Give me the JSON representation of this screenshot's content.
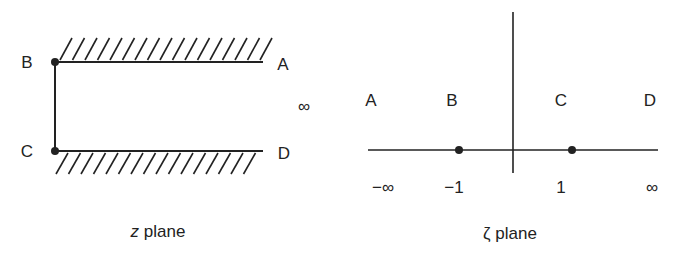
{
  "figure": {
    "left_panel": {
      "caption_var": "z",
      "caption_text": " plane",
      "points": [
        {
          "label": "B",
          "x": 27,
          "y": 62
        },
        {
          "label": "C",
          "x": 27,
          "y": 151
        },
        {
          "label": "A",
          "x": 283,
          "y": 64
        },
        {
          "label": "D",
          "x": 284,
          "y": 153
        }
      ],
      "infinity_label": "∞"
    },
    "right_panel": {
      "caption_var": "ζ",
      "caption_text": " plane",
      "region_labels": [
        {
          "label": "A",
          "x": 371,
          "y": 100
        },
        {
          "label": "B",
          "x": 452,
          "y": 100
        },
        {
          "label": "C",
          "x": 561,
          "y": 100
        },
        {
          "label": "D",
          "x": 650,
          "y": 100
        }
      ],
      "axis_ticks": [
        {
          "label": "−∞",
          "x": 383,
          "y": 187
        },
        {
          "label": "−1",
          "x": 454,
          "y": 187
        },
        {
          "label": "1",
          "x": 561,
          "y": 187
        },
        {
          "label": "∞",
          "x": 652,
          "y": 187
        }
      ],
      "marked_points": [
        -1,
        1
      ]
    },
    "colors": {
      "ink": "#222222",
      "background": "#ffffff"
    }
  }
}
